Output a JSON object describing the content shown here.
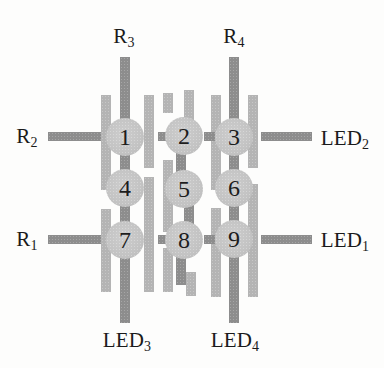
{
  "figure": {
    "canvas": {
      "width": 384,
      "height": 368,
      "background": "#fdfdfc"
    },
    "colors": {
      "dark_trace": "#8d8d8d",
      "light_trace": "#b4b4b4",
      "contact_fill": "#c4c4c4",
      "text": "#1a1a1a"
    },
    "labels": {
      "r3": {
        "base": "R",
        "sub": "3",
        "x": 124,
        "y": 36
      },
      "r4": {
        "base": "R",
        "sub": "4",
        "x": 234,
        "y": 36
      },
      "r2": {
        "base": "R",
        "sub": "2",
        "x": 27,
        "y": 136
      },
      "r1": {
        "base": "R",
        "sub": "1",
        "x": 27,
        "y": 239
      },
      "led2": {
        "base": "LED",
        "sub": "2",
        "x": 345,
        "y": 138
      },
      "led1": {
        "base": "LED",
        "sub": "1",
        "x": 345,
        "y": 240
      },
      "led3": {
        "base": "LED",
        "sub": "3",
        "x": 127,
        "y": 340
      },
      "led4": {
        "base": "LED",
        "sub": "4",
        "x": 235,
        "y": 340
      }
    },
    "contact_radius": 19,
    "contacts": [
      {
        "n": "1",
        "x": 125,
        "y": 137
      },
      {
        "n": "2",
        "x": 184,
        "y": 136
      },
      {
        "n": "3",
        "x": 234,
        "y": 137
      },
      {
        "n": "4",
        "x": 125,
        "y": 188
      },
      {
        "n": "5",
        "x": 184,
        "y": 189
      },
      {
        "n": "6",
        "x": 234,
        "y": 188
      },
      {
        "n": "7",
        "x": 125,
        "y": 240
      },
      {
        "n": "8",
        "x": 184,
        "y": 240
      },
      {
        "n": "9",
        "x": 234,
        "y": 239
      }
    ],
    "bars": [
      {
        "name": "r3-led3-bus",
        "x": 120,
        "y": 57,
        "w": 10,
        "h": 266,
        "tone": "dark"
      },
      {
        "name": "r4-led4-bus",
        "x": 229,
        "y": 57,
        "w": 10,
        "h": 266,
        "tone": "dark"
      },
      {
        "name": "colA-left-flank-upper",
        "x": 101,
        "y": 95,
        "w": 10,
        "h": 95,
        "tone": "light"
      },
      {
        "name": "colA-left-flank-lower",
        "x": 101,
        "y": 209,
        "w": 10,
        "h": 83,
        "tone": "light"
      },
      {
        "name": "colA-right-flank-upper",
        "x": 144,
        "y": 95,
        "w": 10,
        "h": 73,
        "tone": "light"
      },
      {
        "name": "colA-right-flank-lower",
        "x": 144,
        "y": 177,
        "w": 10,
        "h": 115,
        "tone": "light"
      },
      {
        "name": "mid-left-stub-top",
        "x": 163,
        "y": 93,
        "w": 10,
        "h": 20,
        "tone": "light"
      },
      {
        "name": "mid-top-bar",
        "x": 184,
        "y": 90,
        "w": 10,
        "h": 33,
        "tone": "light"
      },
      {
        "name": "mid-left-flank-middle",
        "x": 163,
        "y": 160,
        "w": 10,
        "h": 72,
        "tone": "light"
      },
      {
        "name": "mid-left-flank-lower",
        "x": 163,
        "y": 248,
        "w": 10,
        "h": 44,
        "tone": "light"
      },
      {
        "name": "mid-link-2-5",
        "x": 176,
        "y": 150,
        "w": 10,
        "h": 26,
        "tone": "dark"
      },
      {
        "name": "mid-link-5-8",
        "x": 184,
        "y": 205,
        "w": 10,
        "h": 28,
        "tone": "dark"
      },
      {
        "name": "mid-bottom-bar",
        "x": 176,
        "y": 257,
        "w": 10,
        "h": 28,
        "tone": "dark"
      },
      {
        "name": "mid-bottom-stub",
        "x": 186,
        "y": 272,
        "w": 10,
        "h": 24,
        "tone": "light"
      },
      {
        "name": "colC-left-flank-upper",
        "x": 211,
        "y": 95,
        "w": 10,
        "h": 95,
        "tone": "light"
      },
      {
        "name": "colC-left-flank-lower",
        "x": 211,
        "y": 208,
        "w": 10,
        "h": 89,
        "tone": "light"
      },
      {
        "name": "colC-right-flank-upper",
        "x": 248,
        "y": 95,
        "w": 10,
        "h": 73,
        "tone": "light"
      },
      {
        "name": "colC-right-flank-lower",
        "x": 248,
        "y": 184,
        "w": 10,
        "h": 113,
        "tone": "light"
      },
      {
        "name": "r2-lead",
        "x": 48,
        "y": 132,
        "w": 53,
        "h": 9,
        "tone": "dark"
      },
      {
        "name": "row1-link-left",
        "x": 158,
        "y": 132,
        "w": 12,
        "h": 9,
        "tone": "dark"
      },
      {
        "name": "row1-link-right",
        "x": 204,
        "y": 132,
        "w": 11,
        "h": 9,
        "tone": "dark"
      },
      {
        "name": "led2-lead",
        "x": 261,
        "y": 132,
        "w": 51,
        "h": 9,
        "tone": "dark"
      },
      {
        "name": "r1-lead",
        "x": 48,
        "y": 235,
        "w": 53,
        "h": 9,
        "tone": "dark"
      },
      {
        "name": "row3-link-left",
        "x": 158,
        "y": 235,
        "w": 12,
        "h": 9,
        "tone": "dark"
      },
      {
        "name": "row3-link-right",
        "x": 204,
        "y": 235,
        "w": 11,
        "h": 9,
        "tone": "dark"
      },
      {
        "name": "led1-lead",
        "x": 261,
        "y": 235,
        "w": 51,
        "h": 9,
        "tone": "dark"
      }
    ]
  }
}
